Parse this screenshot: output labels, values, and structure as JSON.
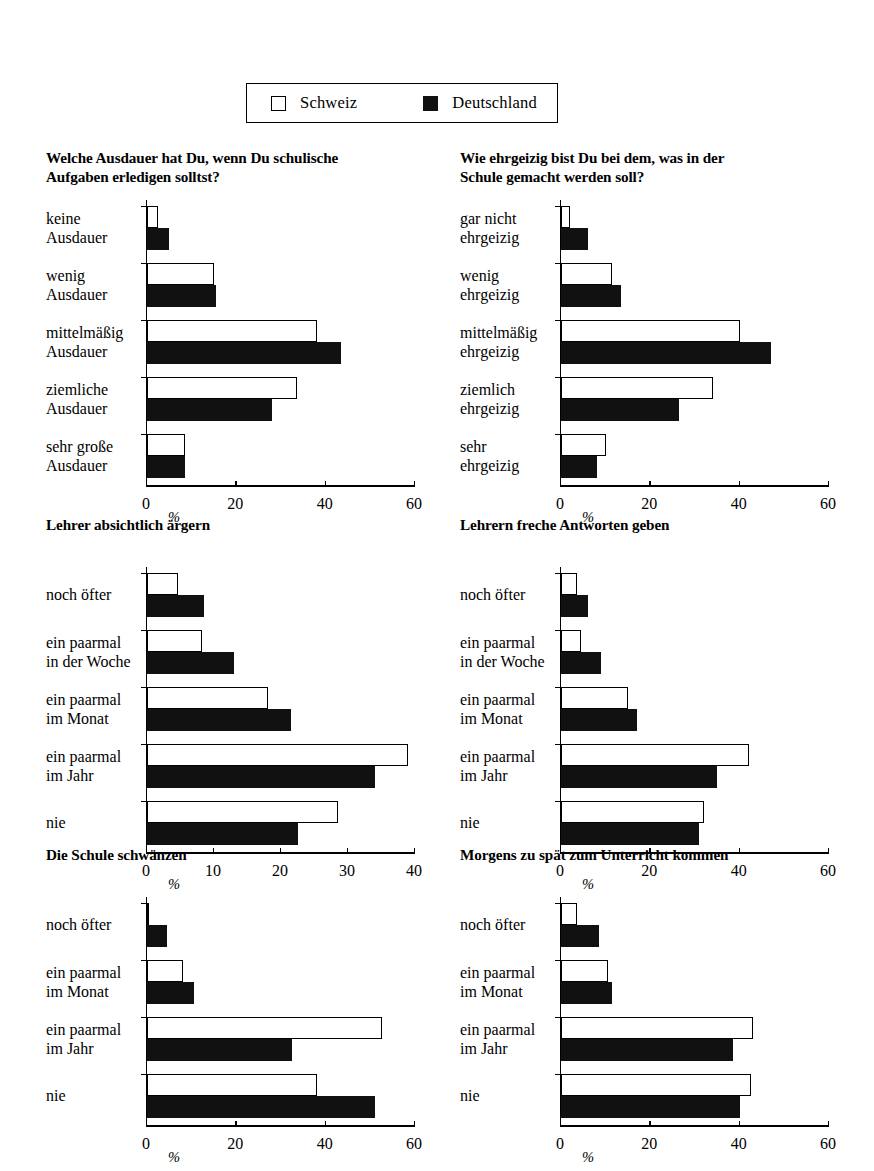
{
  "legend": {
    "series": [
      {
        "label": "Schweiz",
        "swatch": "open-square",
        "color": "#ffffff"
      },
      {
        "label": "Deutschland",
        "swatch": "filled-square",
        "color": "#111111"
      }
    ]
  },
  "axis_unit_label": "%",
  "chart_data": [
    {
      "id": "ausdauer",
      "type": "bar",
      "orientation": "horizontal",
      "title": "Welche Ausdauer hat Du, wenn Du schulische Aufgaben erledigen solltst?",
      "title_lines": [
        "Welche Ausdauer hat Du, wenn Du schulische",
        "Aufgaben erledigen solltst?"
      ],
      "categories": [
        "keine Ausdauer",
        "wenig Ausdauer",
        "mittelmäßig Ausdauer",
        "ziemliche Ausdauer",
        "sehr große Ausdauer"
      ],
      "category_lines": [
        [
          "keine",
          "Ausdauer"
        ],
        [
          "wenig",
          "Ausdauer"
        ],
        [
          "mittelmäßig",
          "Ausdauer"
        ],
        [
          "ziemliche",
          "Ausdauer"
        ],
        [
          "sehr große",
          "Ausdauer"
        ]
      ],
      "series": [
        {
          "name": "Schweiz",
          "values": [
            2.5,
            15.0,
            38.0,
            33.5,
            8.5
          ]
        },
        {
          "name": "Deutschland",
          "values": [
            5.0,
            15.5,
            43.5,
            28.0,
            8.5
          ]
        }
      ],
      "xlabel": "%",
      "ylabel": "",
      "xlim": [
        0,
        60
      ],
      "xticks": [
        0,
        20,
        40,
        60
      ],
      "grid": false,
      "legend_position": "top-shared"
    },
    {
      "id": "ehrgeizig",
      "type": "bar",
      "orientation": "horizontal",
      "title": "Wie ehrgeizig bist Du bei dem, was in der Schule gemacht werden soll?",
      "title_lines": [
        "Wie ehrgeizig bist Du bei dem, was in der",
        "Schule gemacht werden soll?"
      ],
      "categories": [
        "gar nicht ehrgeizig",
        "wenig ehrgeizig",
        "mittelmäßig ehrgeizig",
        "ziemlich ehrgeizig",
        "sehr ehrgeizig"
      ],
      "category_lines": [
        [
          "gar nicht",
          "ehrgeizig"
        ],
        [
          "wenig",
          "ehrgeizig"
        ],
        [
          "mittelmäßig",
          "ehrgeizig"
        ],
        [
          "ziemlich",
          "ehrgeizig"
        ],
        [
          "sehr",
          "ehrgeizig"
        ]
      ],
      "series": [
        {
          "name": "Schweiz",
          "values": [
            2.0,
            11.5,
            40.0,
            34.0,
            10.0
          ]
        },
        {
          "name": "Deutschland",
          "values": [
            6.0,
            13.5,
            47.0,
            26.5,
            8.0
          ]
        }
      ],
      "xlabel": "%",
      "ylabel": "",
      "xlim": [
        0,
        60
      ],
      "xticks": [
        0,
        20,
        40,
        60
      ],
      "grid": false,
      "legend_position": "top-shared"
    },
    {
      "id": "lehrer-aergern",
      "type": "bar",
      "orientation": "horizontal",
      "title": "Lehrer absichtlich ärgern",
      "title_lines": [
        "Lehrer absichtlich ärgern"
      ],
      "categories": [
        "noch öfter",
        "ein paarmal in der Woche",
        "ein paarmal im Monat",
        "ein paarmal im Jahr",
        "nie"
      ],
      "category_lines": [
        [
          "noch öfter"
        ],
        [
          "ein paarmal",
          "in der Woche"
        ],
        [
          "ein paarmal",
          "im Monat"
        ],
        [
          "ein paarmal",
          "im Jahr"
        ],
        [
          "nie"
        ]
      ],
      "series": [
        {
          "name": "Schweiz",
          "values": [
            4.7,
            8.2,
            18.0,
            39.0,
            28.5
          ]
        },
        {
          "name": "Deutschland",
          "values": [
            8.5,
            13.0,
            21.5,
            34.0,
            22.5
          ]
        }
      ],
      "xlabel": "%",
      "ylabel": "",
      "xlim": [
        0,
        40
      ],
      "xticks": [
        0,
        10,
        20,
        30,
        40
      ],
      "grid": false,
      "legend_position": "top-shared"
    },
    {
      "id": "freche-antworten",
      "type": "bar",
      "orientation": "horizontal",
      "title": "Lehrern freche Antworten geben",
      "title_lines": [
        "Lehrern freche Antworten geben"
      ],
      "categories": [
        "noch öfter",
        "ein paarmal in der Woche",
        "ein paarmal im Monat",
        "ein paarmal im Jahr",
        "nie"
      ],
      "category_lines": [
        [
          "noch öfter"
        ],
        [
          "ein paarmal",
          "in der Woche"
        ],
        [
          "ein paarmal",
          "im Monat"
        ],
        [
          "ein paarmal",
          "im Jahr"
        ],
        [
          "nie"
        ]
      ],
      "series": [
        {
          "name": "Schweiz",
          "values": [
            3.5,
            4.5,
            15.0,
            42.0,
            32.0
          ]
        },
        {
          "name": "Deutschland",
          "values": [
            6.0,
            9.0,
            17.0,
            35.0,
            31.0
          ]
        }
      ],
      "xlabel": "%",
      "ylabel": "",
      "xlim": [
        0,
        60
      ],
      "xticks": [
        0,
        20,
        40,
        60
      ],
      "grid": false,
      "legend_position": "top-shared"
    },
    {
      "id": "schule-schwaenzen",
      "type": "bar",
      "orientation": "horizontal",
      "title": "Die Schule schwänzen",
      "title_lines": [
        "Die Schule schwänzen"
      ],
      "categories": [
        "noch öfter",
        "ein paarmal im Monat",
        "ein paarmal im Jahr",
        "nie"
      ],
      "category_lines": [
        [
          "noch öfter"
        ],
        [
          "ein paarmal",
          "im Monat"
        ],
        [
          "ein paarmal",
          "im Jahr"
        ],
        [
          "nie"
        ]
      ],
      "series": [
        {
          "name": "Schweiz",
          "values": [
            0.5,
            8.0,
            52.5,
            38.0
          ]
        },
        {
          "name": "Deutschland",
          "values": [
            4.5,
            10.5,
            32.5,
            51.0
          ]
        }
      ],
      "xlabel": "%",
      "ylabel": "",
      "xlim": [
        0,
        60
      ],
      "xticks": [
        0,
        20,
        40,
        60
      ],
      "grid": false,
      "legend_position": "top-shared"
    },
    {
      "id": "zu-spaet",
      "type": "bar",
      "orientation": "horizontal",
      "title": "Morgens zu spät zum Unterricht kommen",
      "title_lines": [
        "Morgens zu spät zum Unterricht kommen"
      ],
      "categories": [
        "noch öfter",
        "ein paarmal im Monat",
        "ein paarmal im Jahr",
        "nie"
      ],
      "category_lines": [
        [
          "noch öfter"
        ],
        [
          "ein paarmal",
          "im Monat"
        ],
        [
          "ein paarmal",
          "im Jahr"
        ],
        [
          "nie"
        ]
      ],
      "series": [
        {
          "name": "Schweiz",
          "values": [
            3.5,
            10.5,
            43.0,
            42.5
          ]
        },
        {
          "name": "Deutschland",
          "values": [
            8.5,
            11.5,
            38.5,
            40.0
          ]
        }
      ],
      "xlabel": "%",
      "ylabel": "",
      "xlim": [
        0,
        60
      ],
      "xticks": [
        0,
        20,
        40,
        60
      ],
      "grid": false,
      "legend_position": "top-shared"
    }
  ]
}
